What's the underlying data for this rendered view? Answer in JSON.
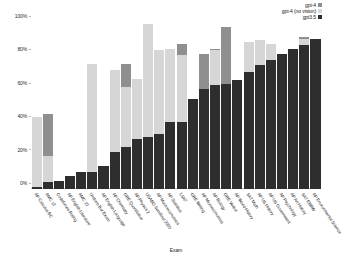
{
  "chart_data": {
    "type": "bar",
    "title": "",
    "subtitle": "",
    "xlabel": "Exam",
    "ylabel": "",
    "stacked": true,
    "grid": false,
    "legend_position": "top-right",
    "ylim": [
      0,
      100
    ],
    "yticks": [
      0,
      20,
      40,
      60,
      80,
      100
    ],
    "ytick_labels": [
      "0%",
      "20%",
      "40%",
      "60%",
      "80%",
      "100%"
    ],
    "categories": [
      "AP Calculus BC",
      "AMC 12",
      "Codeforces Rating",
      "AP English Literature",
      "AMC 10",
      "Uniform Bar Exam",
      "AP English Language",
      "AP Chemistry",
      "GRE Quantitative",
      "AP Physics 2",
      "USABO Semifinal 2020",
      "AP Macroeconomics",
      "AP Statistics",
      "LSAT",
      "GRE Writing",
      "AP Microeconomics",
      "AP Biology",
      "GRE Verbal",
      "AP World History",
      "SAT Math",
      "AP US History",
      "AP US Government",
      "AP Psychology",
      "AP Art History",
      "SAT EBRW",
      "AP Environmental Science"
    ],
    "series": [
      {
        "name": "gpt3.5",
        "color": "#2e2e2e",
        "values": [
          1,
          4,
          5,
          8,
          10,
          10,
          14,
          22,
          25,
          30,
          31,
          33,
          40,
          40,
          54,
          60,
          62,
          63,
          65,
          70,
          74,
          77,
          81,
          84,
          86,
          90
        ]
      },
      {
        "name": "gpt-4 (no vision)",
        "color": "#d6d6d6",
        "values": [
          43,
          20,
          5,
          8,
          10,
          75,
          14,
          71,
          61,
          66,
          99,
          83,
          84,
          80,
          54,
          60,
          83,
          62,
          65,
          88,
          89,
          87,
          81,
          84,
          90,
          90
        ]
      },
      {
        "name": "gpt-4",
        "color": "#8f8f8f",
        "values": [
          43,
          45,
          5,
          8,
          10,
          75,
          14,
          71,
          75,
          66,
          99,
          83,
          84,
          87,
          54,
          81,
          84,
          97,
          65,
          88,
          89,
          87,
          81,
          84,
          91,
          90
        ]
      }
    ]
  },
  "legend": {
    "entries": [
      {
        "label": "gpt-4",
        "color": "#8f8f8f"
      },
      {
        "label": "gpt-4 (no vision)",
        "color": "#d6d6d6"
      },
      {
        "label": "gpt3.5",
        "color": "#2e2e2e"
      }
    ]
  }
}
